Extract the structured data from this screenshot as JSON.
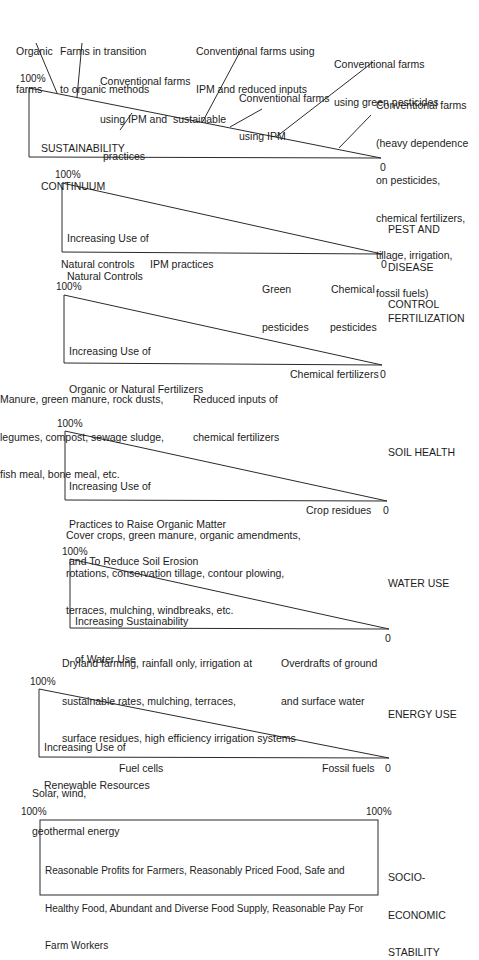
{
  "continuum": {
    "title_line1": "SUSTAINABILITY",
    "title_line2": "CONTINUUM",
    "max_label": "100%",
    "min_label": "0",
    "callouts": [
      {
        "line1": "Organic",
        "line2": "farms"
      },
      {
        "line1": "Farms in transition",
        "line2": "to organic methods"
      },
      {
        "line1": "Conventional farms",
        "line2": "using IPM and  sustainable",
        "line3": "practices"
      },
      {
        "line1": "Conventional farms using",
        "line2": "IPM and reduced inputs"
      },
      {
        "line1": "Conventional farms",
        "line2": "using IPM"
      },
      {
        "line1": "Conventional farms",
        "line2": "using green pesticides"
      },
      {
        "line1": "Conventional farms",
        "line2": "(heavy dependence",
        "line3": "on pesticides,",
        "line4": "chemical fertilizers,",
        "line5": "tillage, irrigation,",
        "line6": "fossil fuels)"
      }
    ]
  },
  "panels": {
    "pest": {
      "category_line1": "PEST AND",
      "category_line2": "DISEASE",
      "category_line3": "CONTROL",
      "inner_line1": "Increasing Use of",
      "inner_line2": "Natural Controls",
      "max_label": "100%",
      "min_label": "0",
      "scale": [
        {
          "line1": "Natural controls"
        },
        {
          "line1": "IPM practices"
        },
        {
          "line1": "Green",
          "line2": "pesticides"
        },
        {
          "line1": "Chemical",
          "line2": "pesticides"
        }
      ]
    },
    "fertilization": {
      "category_line1": "FERTILIZATION",
      "inner_line1": "Increasing Use of",
      "inner_line2": "Organic or Natural Fertilizers",
      "max_label": "100%",
      "min_label": "0",
      "scale": [
        {
          "line1": "Manure, green manure, rock dusts,",
          "line2": "legumes, compost, sewage sludge,",
          "line3": "fish meal, bone meal, etc."
        },
        {
          "line1": "Reduced inputs of",
          "line2": "chemical fertilizers"
        },
        {
          "line1": "Chemical fertilizers"
        }
      ]
    },
    "soil": {
      "category_line1": "SOIL HEALTH",
      "inner_line1": "Increasing Use of",
      "inner_line2": "Practices to Raise Organic Matter",
      "inner_line3": "and To Reduce Soil Erosion",
      "max_label": "100%",
      "min_label": "0",
      "scale": [
        {
          "line1": "Cover crops, green manure, organic amendments,",
          "line2": "rotations, conservation tillage, contour plowing,",
          "line3": "terraces, mulching, windbreaks, etc."
        },
        {
          "line1": "Crop residues"
        }
      ]
    },
    "water": {
      "category_line1": "WATER USE",
      "inner_line1": "Increasing Sustainability",
      "inner_line2": "of Water Use",
      "max_label": "100%",
      "min_label": "0",
      "scale": [
        {
          "line1": "Dryland farming, rainfall only, irrigation at",
          "line2": "sustainable rates, mulching, terraces,",
          "line3": "surface residues, high efficiency irrigation systems"
        },
        {
          "line1": "Overdrafts of ground",
          "line2": "and surface water"
        }
      ]
    },
    "energy": {
      "category_line1": "ENERGY USE",
      "inner_line1": "Increasing Use of",
      "inner_line2": "Renewable Resources",
      "max_label": "100%",
      "min_label": "0",
      "scale": [
        {
          "line1": "Solar, wind,",
          "line2": "geothermal energy"
        },
        {
          "line1": "Fuel cells"
        },
        {
          "line1": "Fossil fuels"
        }
      ]
    },
    "socio": {
      "category_line1": "SOCIO-",
      "category_line2": "ECONOMIC",
      "category_line3": "STABILITY",
      "inner_line1": "Reasonable Profits for Farmers, Reasonably Priced Food, Safe and",
      "inner_line2": "Healthy Food, Abundant and Diverse Food Supply, Reasonable Pay For",
      "inner_line3": "Farm Workers",
      "left_label": "100%",
      "right_label": "100%"
    }
  },
  "colors": {
    "line": "#2a2a2a",
    "text": "#1c1c1c",
    "background": "#ffffff"
  }
}
